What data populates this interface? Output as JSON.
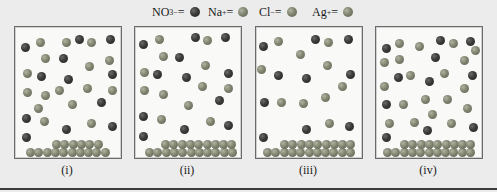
{
  "legend": [
    {
      "formula": "NO",
      "sub": "3",
      "sup": "−",
      "eq": " =",
      "ball": "dark",
      "color": "#3a3a38"
    },
    {
      "formula": "Na",
      "sub": "",
      "sup": "+",
      "eq": " =",
      "ball": "med",
      "color": "#808570"
    },
    {
      "formula": "Cl",
      "sub": "",
      "sup": "−",
      "eq": " =",
      "ball": "med",
      "color": "#808570"
    },
    {
      "formula": "Ag",
      "sub": "",
      "sup": "+",
      "eq": " =",
      "ball": "med",
      "color": "#808570"
    }
  ],
  "panels": [
    {
      "label": "(i)",
      "left": 14,
      "ions": [
        [
          "dark",
          10,
          20
        ],
        [
          "med",
          25,
          15
        ],
        [
          "med",
          51,
          15
        ],
        [
          "dark",
          64,
          12
        ],
        [
          "med",
          76,
          15
        ],
        [
          "dark",
          95,
          12
        ],
        [
          "med",
          30,
          31
        ],
        [
          "dark",
          48,
          31
        ],
        [
          "med",
          74,
          39
        ],
        [
          "med",
          94,
          33
        ],
        [
          "med",
          12,
          46
        ],
        [
          "dark",
          26,
          49
        ],
        [
          "dark",
          53,
          52
        ],
        [
          "dark",
          97,
          47
        ],
        [
          "med",
          12,
          65
        ],
        [
          "med",
          30,
          68
        ],
        [
          "med",
          44,
          63
        ],
        [
          "med",
          72,
          61
        ],
        [
          "med",
          97,
          63
        ],
        [
          "med",
          23,
          81
        ],
        [
          "med",
          57,
          77
        ],
        [
          "dark",
          86,
          75
        ],
        [
          "dark",
          11,
          91
        ],
        [
          "med",
          29,
          94
        ],
        [
          "dark",
          51,
          102
        ],
        [
          "med",
          76,
          96
        ],
        [
          "dark",
          97,
          99
        ],
        [
          "dark",
          11,
          110
        ]
      ],
      "solid": {
        "bottom_start": 11,
        "bottom_count": 10,
        "top_start": 37,
        "top_count": 6
      }
    },
    {
      "label": "(ii)",
      "left": 134,
      "ions": [
        [
          "dark",
          8,
          17
        ],
        [
          "med",
          24,
          12
        ],
        [
          "dark",
          60,
          10
        ],
        [
          "med",
          72,
          13
        ],
        [
          "dark",
          90,
          10
        ],
        [
          "med",
          28,
          29
        ],
        [
          "dark",
          44,
          30
        ],
        [
          "med",
          70,
          38
        ],
        [
          "med",
          9,
          45
        ],
        [
          "dark",
          22,
          47
        ],
        [
          "dark",
          51,
          50
        ],
        [
          "dark",
          93,
          46
        ],
        [
          "med",
          9,
          63
        ],
        [
          "med",
          28,
          67
        ],
        [
          "med",
          67,
          59
        ],
        [
          "med",
          93,
          61
        ],
        [
          "med",
          53,
          78
        ],
        [
          "dark",
          84,
          73
        ],
        [
          "dark",
          8,
          89
        ],
        [
          "med",
          26,
          92
        ],
        [
          "dark",
          49,
          102
        ],
        [
          "med",
          75,
          94
        ],
        [
          "dark",
          93,
          98
        ],
        [
          "dark",
          8,
          109
        ]
      ],
      "solid": {
        "bottom_start": 10,
        "bottom_count": 11,
        "top_start": 26,
        "top_count": 9
      }
    },
    {
      "label": "(iii)",
      "left": 255,
      "ions": [
        [
          "dark",
          7,
          19
        ],
        [
          "med",
          22,
          14
        ],
        [
          "dark",
          59,
          12
        ],
        [
          "med",
          72,
          15
        ],
        [
          "dark",
          92,
          12
        ],
        [
          "med",
          44,
          27
        ],
        [
          "med",
          71,
          38
        ],
        [
          "med",
          5,
          42
        ],
        [
          "dark",
          22,
          48
        ],
        [
          "dark",
          50,
          51
        ],
        [
          "dark",
          94,
          47
        ],
        [
          "med",
          86,
          59
        ],
        [
          "med",
          69,
          70
        ],
        [
          "dark",
          8,
          75
        ],
        [
          "med",
          25,
          75
        ],
        [
          "med",
          47,
          76
        ],
        [
          "med",
          73,
          96
        ],
        [
          "dark",
          50,
          102
        ],
        [
          "dark",
          93,
          99
        ],
        [
          "dark",
          7,
          110
        ]
      ],
      "solid": {
        "bottom_start": 7,
        "bottom_count": 11,
        "top_start": 24,
        "top_count": 9
      }
    },
    {
      "label": "(iv)",
      "left": 375,
      "ions": [
        [
          "dark",
          10,
          21
        ],
        [
          "med",
          23,
          16
        ],
        [
          "med",
          43,
          19
        ],
        [
          "dark",
          64,
          13
        ],
        [
          "med",
          77,
          16
        ],
        [
          "dark",
          94,
          14
        ],
        [
          "med",
          99,
          23
        ],
        [
          "med",
          8,
          35
        ],
        [
          "med",
          23,
          32
        ],
        [
          "dark",
          59,
          30
        ],
        [
          "med",
          88,
          33
        ],
        [
          "dark",
          22,
          50
        ],
        [
          "med",
          34,
          48
        ],
        [
          "med",
          68,
          46
        ],
        [
          "dark",
          53,
          54
        ],
        [
          "dark",
          96,
          48
        ],
        [
          "med",
          8,
          59
        ],
        [
          "med",
          88,
          61
        ],
        [
          "dark",
          10,
          77
        ],
        [
          "med",
          27,
          77
        ],
        [
          "med",
          49,
          72
        ],
        [
          "med",
          71,
          72
        ],
        [
          "med",
          91,
          81
        ],
        [
          "med",
          56,
          87
        ],
        [
          "med",
          13,
          96
        ],
        [
          "med",
          38,
          95
        ],
        [
          "med",
          75,
          96
        ],
        [
          "dark",
          51,
          103
        ],
        [
          "dark",
          97,
          100
        ],
        [
          "dark",
          10,
          110
        ]
      ],
      "solid": {
        "bottom_start": 7,
        "bottom_count": 11,
        "top_start": 24,
        "top_count": 9
      }
    }
  ]
}
